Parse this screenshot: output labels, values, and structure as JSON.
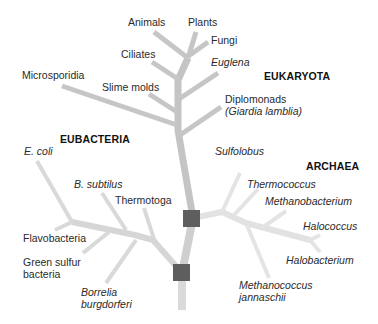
{
  "diagram": {
    "type": "phylogenetic-tree",
    "colors": {
      "eukaryota_branch": "#c4c4c4",
      "bacteria_branch": "#d6d6d6",
      "archaea_branch": "#e2e2e2",
      "node_square": "#5e5e5e",
      "text": "#2a2a2a"
    },
    "domains": {
      "eukaryota": "EUKARYOTA",
      "eubacteria": "EUBACTERIA",
      "archaea": "ARCHAEA"
    },
    "eukaryota_leaves": {
      "animals": "Animals",
      "plants": "Plants",
      "fungi": "Fungi",
      "ciliates": "Ciliates",
      "euglena": "Euglena",
      "microsporidia": "Microsporidia",
      "slime_molds": "Slime molds",
      "diplomonads": "Diplomonads",
      "giardia": "(Giardia lamblia)"
    },
    "eubacteria_leaves": {
      "e_coli": "E. coli",
      "b_subtilus": "B. subtilus",
      "thermotoga": "Thermotoga",
      "flavobacteria": "Flavobacteria",
      "green_sulfur_1": "Green sulfur",
      "green_sulfur_2": "bacteria",
      "borrelia_1": "Borrelia",
      "borrelia_2": "burgdorferi"
    },
    "archaea_leaves": {
      "sulfolobus": "Sulfolobus",
      "thermococcus": "Thermococcus",
      "methanobacterium": "Methanobacterium",
      "halococcus": "Halococcus",
      "halobacterium": "Halobacterium",
      "methanococcus_1": "Methanococcus",
      "methanococcus_2": "jannaschii"
    }
  }
}
